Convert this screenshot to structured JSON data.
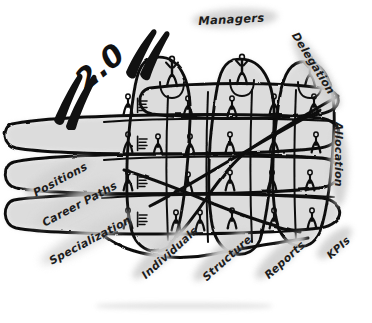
{
  "image": {
    "kind": "hand-drawn-sketch",
    "subject": "matrix-organization",
    "width": 372,
    "height": 323,
    "background_color": "#ffffff",
    "ink_color": "#111111",
    "highlight_color": "#d2d2d2",
    "fill_color": "#d9d9d9"
  },
  "headline": {
    "text": "2.0",
    "open_quote": "“",
    "close_quote": "”",
    "rotation_deg": -40
  },
  "labels": [
    {
      "id": "managers",
      "text": "Managers",
      "x": 198,
      "y": 14,
      "rotation_deg": -3,
      "font_size": 11.5,
      "hl_w": 86,
      "hl_h": 19
    },
    {
      "id": "delegation",
      "text": "Delegation",
      "x": 300,
      "y": 30,
      "rotation_deg": 58,
      "font_size": 11,
      "hl_w": 84,
      "hl_h": 19
    },
    {
      "id": "allocation",
      "text": "Allocation",
      "x": 345,
      "y": 122,
      "rotation_deg": 90,
      "font_size": 11,
      "hl_w": 78,
      "hl_h": 18
    },
    {
      "id": "kpis",
      "text": "KPIs",
      "x": 324,
      "y": 252,
      "rotation_deg": -42,
      "font_size": 10.5,
      "hl_w": 44,
      "hl_h": 17
    },
    {
      "id": "reports",
      "text": "Reports",
      "x": 262,
      "y": 272,
      "rotation_deg": -42,
      "font_size": 11,
      "hl_w": 66,
      "hl_h": 18
    },
    {
      "id": "structure",
      "text": "Structure",
      "x": 200,
      "y": 274,
      "rotation_deg": -42,
      "font_size": 11,
      "hl_w": 72,
      "hl_h": 18
    },
    {
      "id": "individuals",
      "text": "Individuals",
      "x": 139,
      "y": 272,
      "rotation_deg": -42,
      "font_size": 11,
      "hl_w": 78,
      "hl_h": 18
    },
    {
      "id": "specialization",
      "text": "Specialization",
      "x": 47,
      "y": 256,
      "rotation_deg": -28,
      "font_size": 11,
      "hl_w": 104,
      "hl_h": 19
    },
    {
      "id": "career-paths",
      "text": "Career Paths",
      "x": 40,
      "y": 218,
      "rotation_deg": -28,
      "font_size": 11,
      "hl_w": 92,
      "hl_h": 19
    },
    {
      "id": "positions",
      "text": "Positions",
      "x": 31,
      "y": 188,
      "rotation_deg": -28,
      "font_size": 11,
      "hl_w": 74,
      "hl_h": 19
    }
  ],
  "diagram": {
    "managers_count": 3,
    "column_groups": 3,
    "row_groups": 4,
    "staff_figures": 20
  }
}
